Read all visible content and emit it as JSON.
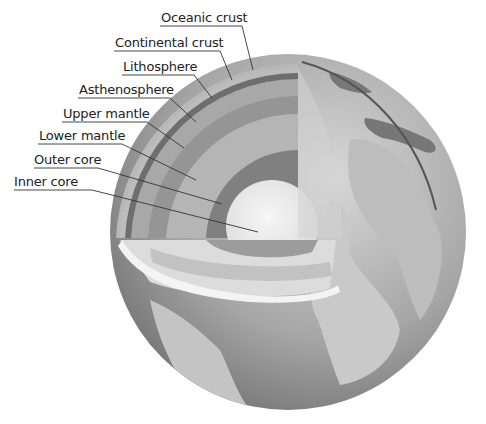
{
  "labels": [
    {
      "key": "oceanic_crust",
      "text": "Oceanic crust"
    },
    {
      "key": "continental_crust",
      "text": "Continental crust"
    },
    {
      "key": "lithosphere",
      "text": "Lithosphere"
    },
    {
      "key": "asthenosphere",
      "text": "Asthenosphere"
    },
    {
      "key": "upper_mantle",
      "text": "Upper mantle"
    },
    {
      "key": "lower_mantle",
      "text": "Lower mantle"
    },
    {
      "key": "outer_core",
      "text": "Outer core"
    },
    {
      "key": "inner_core",
      "text": "Inner core"
    }
  ],
  "colors": {
    "background": "#ffffff",
    "ocean": "#8a8a8a",
    "land": "#c8c8c8",
    "crust": "#b4b4b4",
    "lithosphere": "#6e6e6e",
    "asthenosphere": "#a2a2a2",
    "upper_mantle": "#9a9a9a",
    "lower_mantle": "#b8b8b8",
    "outer_core": "#7f7f7f",
    "inner_core": "#ececec",
    "leader_line": "#333333"
  }
}
